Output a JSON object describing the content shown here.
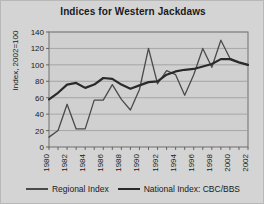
{
  "chart_data": {
    "type": "line",
    "title": "Indices for Western Jackdaws",
    "xlabel": "",
    "ylabel": "Index, 2002=100",
    "ylim": [
      0,
      140
    ],
    "ytick_step": 20,
    "yticks": [
      0,
      20,
      40,
      60,
      80,
      100,
      120,
      140
    ],
    "xlim": [
      1980,
      2002
    ],
    "x": [
      1980,
      1981,
      1982,
      1983,
      1984,
      1985,
      1986,
      1987,
      1988,
      1989,
      1990,
      1991,
      1992,
      1993,
      1994,
      1995,
      1996,
      1997,
      1998,
      1999,
      2000,
      2001,
      2002
    ],
    "xtick_labels": [
      "1980",
      "1982",
      "1984",
      "1986",
      "1988",
      "1990",
      "1992",
      "1994",
      "1996",
      "1998",
      "2000",
      "2002"
    ],
    "xtick_values": [
      1980,
      1982,
      1984,
      1986,
      1988,
      1990,
      1992,
      1994,
      1996,
      1998,
      2000,
      2002
    ],
    "grid": true,
    "grid_axis": "y",
    "legend_position": "bottom",
    "series": [
      {
        "name": "Regional Index",
        "color": "#4a4a4a",
        "width": 1.3,
        "values": [
          12,
          20,
          52,
          22,
          22,
          57,
          57,
          76,
          58,
          45,
          70,
          120,
          77,
          93,
          88,
          63,
          88,
          120,
          97,
          130,
          108,
          103,
          100
        ]
      },
      {
        "name": "National Index: CBC/BBS",
        "color": "#2a2a2a",
        "width": 2.2,
        "values": [
          58,
          66,
          76,
          78,
          72,
          76,
          84,
          83,
          76,
          71,
          75,
          79,
          80,
          88,
          92,
          94,
          95,
          98,
          101,
          107,
          107,
          103,
          100
        ]
      }
    ]
  },
  "legend": {
    "items": [
      {
        "label": "Regional Index",
        "style": "thin"
      },
      {
        "label": "National Index: CBC/BBS",
        "style": "thick"
      }
    ]
  }
}
